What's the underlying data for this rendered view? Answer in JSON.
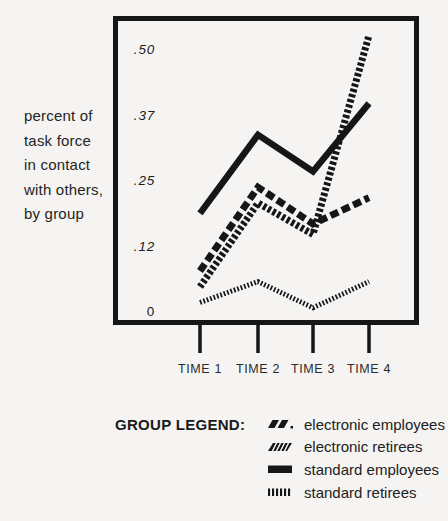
{
  "figure": {
    "background": "#f5f4f2",
    "ink": "#161616"
  },
  "caption": {
    "lines": [
      "percent of",
      "task force",
      "in contact",
      "with others,",
      "by group"
    ]
  },
  "chart_data": {
    "type": "line",
    "title": "",
    "xlabel": "",
    "ylabel": "percent of task force in contact with others, by group",
    "x_categories": [
      "TIME 1",
      "TIME 2",
      "TIME 3",
      "TIME 4"
    ],
    "y_ticks": [
      {
        "label": ".50",
        "value": 0.5
      },
      {
        "label": ".37",
        "value": 0.375
      },
      {
        "label": ".25",
        "value": 0.25
      },
      {
        "label": ".12",
        "value": 0.125
      },
      {
        "label": "0",
        "value": 0
      }
    ],
    "ylim": [
      0,
      0.56
    ],
    "grid": false,
    "legend_position": "bottom",
    "series": [
      {
        "name": "electronic employees",
        "style": "chunky-dash",
        "values": [
          0.08,
          0.24,
          0.17,
          0.22
        ]
      },
      {
        "name": "electronic retirees",
        "style": "fine-hatch",
        "values": [
          0.05,
          0.21,
          0.15,
          0.53
        ]
      },
      {
        "name": "standard employees",
        "style": "solid",
        "values": [
          0.19,
          0.34,
          0.27,
          0.4
        ]
      },
      {
        "name": "standard retirees",
        "style": "vertical-hatch",
        "values": [
          0.02,
          0.06,
          0.01,
          0.06
        ]
      }
    ]
  },
  "legend": {
    "title": "GROUP LEGEND:",
    "items": [
      {
        "label": "electronic employees",
        "style": "chunky-dash"
      },
      {
        "label": "electronic retirees",
        "style": "fine-hatch"
      },
      {
        "label": "standard employees",
        "style": "solid"
      },
      {
        "label": "standard retirees",
        "style": "vertical-hatch"
      }
    ]
  }
}
